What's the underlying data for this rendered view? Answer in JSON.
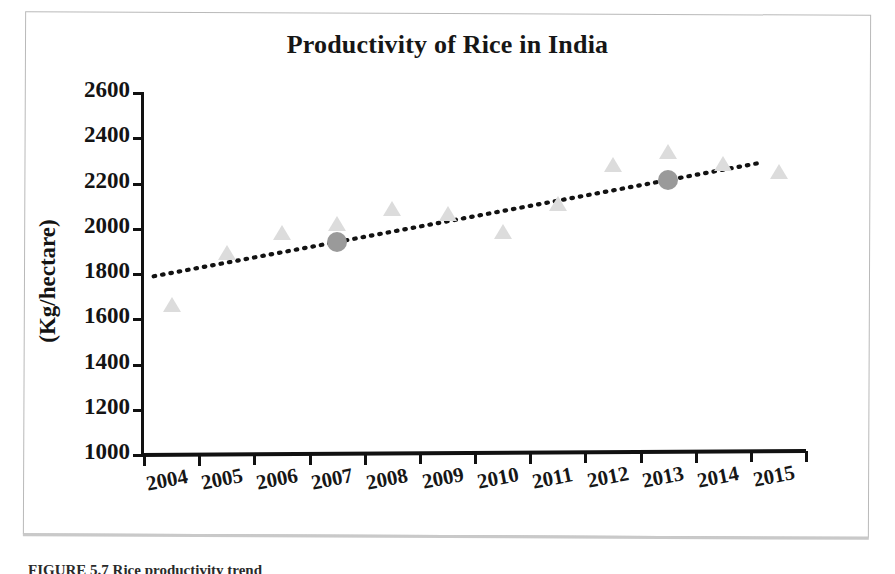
{
  "figure": {
    "caption": "FIGURE 5.7   Rice productivity trend",
    "frame_color": "#b9b9b9"
  },
  "chart_data": {
    "type": "scatter",
    "title": "Productivity of Rice in India",
    "xlabel": "",
    "ylabel": "(Kg/hectare)",
    "categories": [
      "2004",
      "2005",
      "2006",
      "2007",
      "2008",
      "2009",
      "2010",
      "2011",
      "2012",
      "2013",
      "2014",
      "2015"
    ],
    "x": [
      2004,
      2005,
      2006,
      2007,
      2008,
      2009,
      2010,
      2011,
      2012,
      2013,
      2014,
      2015
    ],
    "ylim": [
      1000,
      2600
    ],
    "yticks": [
      1000,
      1200,
      1400,
      1600,
      1800,
      2000,
      2200,
      2400,
      2600
    ],
    "grid": false,
    "legend": "none",
    "series": [
      {
        "name": "Productivity",
        "marker": "triangle",
        "color": "#dcdcdc",
        "values": [
          1663,
          1893,
          1981,
          2020,
          2086,
          2064,
          1986,
          2110,
          2283,
          2340,
          2287,
          2251
        ]
      },
      {
        "name": "Highlighted years",
        "marker": "circle",
        "color": "#9a9a9a",
        "points": [
          {
            "x": 2007,
            "y": 1941
          },
          {
            "x": 2013,
            "y": 2215
          }
        ]
      }
    ],
    "trendline": {
      "style": "dotted",
      "color": "#121212",
      "x_start": 2004,
      "y_start": 1790,
      "x_end": 2015,
      "y_end": 2290
    },
    "colors": {
      "marker_light": "#dcdcdc",
      "marker_dark": "#9a9a9a",
      "axis": "#111111",
      "text": "#141414"
    }
  }
}
